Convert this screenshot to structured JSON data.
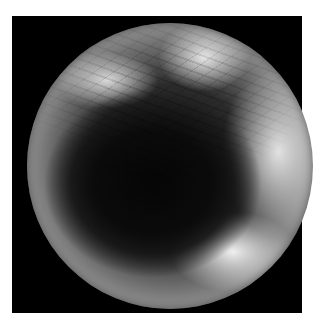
{
  "image": {
    "description": "Grayscale circular endoscopic view on black square background",
    "colors": {
      "background": "#ffffff",
      "frame": "#000000",
      "lumen": "#0b0b0b",
      "mucosa_highlight": "#e6e6e6"
    }
  }
}
